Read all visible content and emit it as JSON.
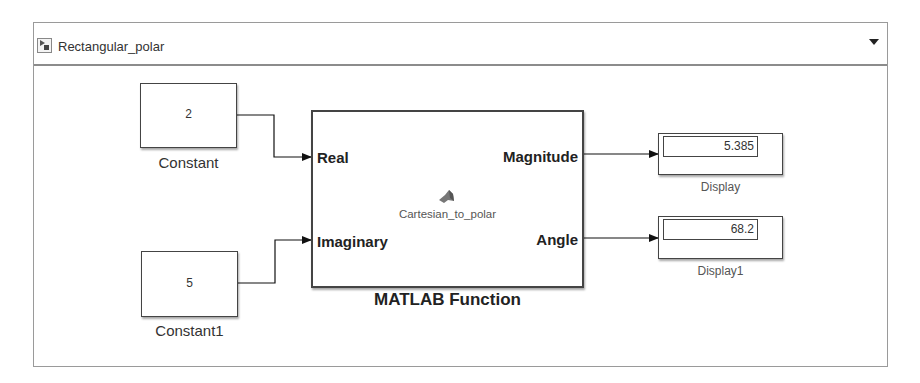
{
  "model": {
    "title": "Rectangular_polar",
    "icon": "simulink-model-icon",
    "dropdown_icon": "caret-down-icon"
  },
  "blocks": {
    "constant": {
      "value": "2",
      "label": "Constant"
    },
    "constant1": {
      "value": "5",
      "label": "Constant1"
    },
    "matlab_function": {
      "label": "MATLAB Function",
      "function_name": "Cartesian_to_polar",
      "icon": "matlab-logo-icon",
      "inputs": [
        "Real",
        "Imaginary"
      ],
      "outputs": [
        "Magnitude",
        "Angle"
      ]
    },
    "display": {
      "value": "5.385",
      "label": "Display"
    },
    "display1": {
      "value": "68.2",
      "label": "Display1"
    }
  }
}
